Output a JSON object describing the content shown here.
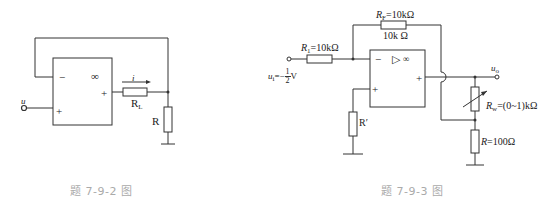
{
  "figure_left": {
    "caption": "题 7-9-2 图",
    "opamp": {
      "minus": "−",
      "plus_in": "+",
      "plus_out": "+",
      "gain": "∞"
    },
    "input_label": "u",
    "current_label": "i",
    "load_resistor": {
      "name": "R",
      "sub": "L"
    },
    "resistor": {
      "name": "R"
    }
  },
  "figure_right": {
    "caption": "题 7-9-3 图",
    "opamp": {
      "minus": "−",
      "plus_in": "+",
      "plus_out": "+",
      "triangle": "▷",
      "gain": "∞"
    },
    "input": {
      "name": "u",
      "sub": "i",
      "eq": "=−",
      "num": "1",
      "den": "2",
      "unit": "V"
    },
    "r1": {
      "name": "R",
      "sub": "1",
      "value": "=10kΩ"
    },
    "rf": {
      "name": "R",
      "sub": "F",
      "value": "=10kΩ",
      "extra": "10k Ω"
    },
    "rprime": {
      "name": "R′"
    },
    "output": {
      "name": "u",
      "sub": "o"
    },
    "rw": {
      "name": "R",
      "sub": "w",
      "value": "=(0~1)kΩ"
    },
    "r": {
      "name": "R",
      "value": "=100Ω"
    }
  }
}
